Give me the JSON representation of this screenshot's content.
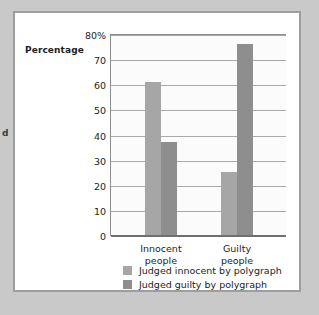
{
  "margin_fragment": "d",
  "chart_data": {
    "type": "bar",
    "title": "",
    "xlabel": "",
    "ylabel": "Percentage",
    "ylim": [
      0,
      80
    ],
    "grid": true,
    "legend_position": "bottom",
    "categories": [
      "Innocent people",
      "Guilty people"
    ],
    "category_lines": [
      [
        "Innocent",
        "people"
      ],
      [
        "Guilty",
        "people"
      ]
    ],
    "tick_labels": [
      "80%",
      "70",
      "60",
      "50",
      "40",
      "30",
      "20",
      "10",
      "0"
    ],
    "tick_values": [
      80,
      70,
      60,
      50,
      40,
      30,
      20,
      10,
      0
    ],
    "series": [
      {
        "name": "Judged innocent by polygraph",
        "color": "#a6a6a6",
        "values": [
          61,
          25
        ]
      },
      {
        "name": "Judged guilty by polygraph",
        "color": "#8e8e8e",
        "values": [
          37,
          76
        ]
      }
    ]
  },
  "colors": {
    "page_background": "#c9c9c9",
    "card_background": "#ffffff",
    "card_border": "#9e9e9e",
    "plot_background": "#fbfbfb",
    "gridline": "#a9a9a9",
    "axis": "#6f6f6f",
    "text": "#1d1d1d"
  }
}
